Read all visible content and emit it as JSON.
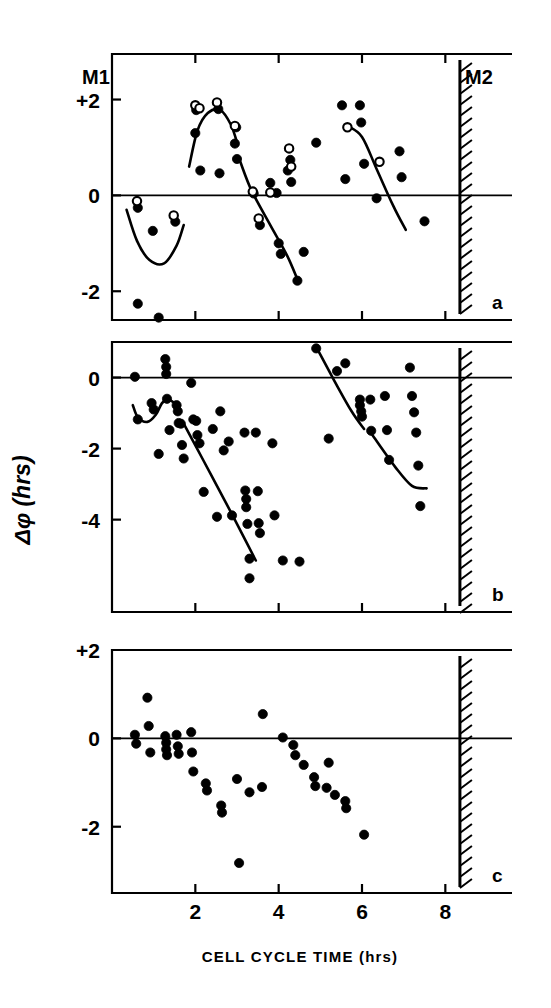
{
  "figure": {
    "title": "",
    "xlabel": "CELL CYCLE TIME (hrs)",
    "ylabel": "Δφ (hrs)",
    "m1_label": "M1",
    "m2_label": "M2",
    "panel_a_label": "a",
    "panel_b_label": "b",
    "panel_c_label": "c",
    "ink_color": "#000000",
    "background_color": "#ffffff"
  },
  "chart_data": [
    {
      "type": "scatter",
      "panel": "a",
      "title": "",
      "xlabel": "CELL CYCLE TIME (hrs)",
      "ylabel": "Δφ (hrs)",
      "xlim": [
        0,
        9.6
      ],
      "ylim": [
        -2.6,
        2.95
      ],
      "xticks": [
        2,
        4,
        6,
        8
      ],
      "xticklabels": [
        "2",
        "4",
        "6",
        "8"
      ],
      "yticks": [
        2,
        0,
        -2
      ],
      "yticklabels": [
        "+2",
        "0",
        "-2"
      ],
      "grid": false,
      "zero_line": true,
      "m2_bar_x": 8.35,
      "annotations": [
        "M1",
        "M2",
        "a"
      ],
      "series": [
        {
          "name": "filled-circles",
          "marker": "filled",
          "points": [
            [
              0.62,
              -0.26
            ],
            [
              0.62,
              -2.26
            ],
            [
              0.98,
              -0.74
            ],
            [
              1.12,
              -2.55
            ],
            [
              1.52,
              -0.55
            ],
            [
              2.0,
              1.3
            ],
            [
              2.02,
              1.78
            ],
            [
              2.12,
              0.52
            ],
            [
              2.55,
              1.8
            ],
            [
              2.58,
              0.46
            ],
            [
              2.95,
              1.08
            ],
            [
              2.98,
              1.42
            ],
            [
              3.0,
              0.76
            ],
            [
              3.4,
              0.04
            ],
            [
              3.55,
              -0.62
            ],
            [
              3.8,
              0.26
            ],
            [
              3.95,
              0.05
            ],
            [
              4.0,
              -1.0
            ],
            [
              4.05,
              -1.22
            ],
            [
              4.22,
              0.52
            ],
            [
              4.28,
              0.74
            ],
            [
              4.3,
              0.28
            ],
            [
              4.45,
              -1.78
            ],
            [
              4.6,
              -1.18
            ],
            [
              4.9,
              1.1
            ],
            [
              5.52,
              1.88
            ],
            [
              5.6,
              0.34
            ],
            [
              5.95,
              1.88
            ],
            [
              5.98,
              1.52
            ],
            [
              6.05,
              0.66
            ],
            [
              6.35,
              -0.06
            ],
            [
              6.9,
              0.92
            ],
            [
              6.95,
              0.38
            ],
            [
              7.5,
              -0.54
            ]
          ]
        },
        {
          "name": "open-circles",
          "marker": "open",
          "points": [
            [
              0.6,
              -0.12
            ],
            [
              1.48,
              -0.42
            ],
            [
              2.0,
              1.88
            ],
            [
              2.1,
              1.82
            ],
            [
              2.52,
              1.94
            ],
            [
              2.95,
              1.45
            ],
            [
              3.38,
              0.08
            ],
            [
              3.52,
              -0.48
            ],
            [
              3.8,
              0.06
            ],
            [
              4.25,
              0.98
            ],
            [
              4.3,
              0.6
            ],
            [
              5.65,
              1.42
            ],
            [
              6.42,
              0.7
            ]
          ]
        }
      ],
      "curves": [
        {
          "name": "curve-1",
          "points": [
            [
              0.35,
              -0.3
            ],
            [
              0.6,
              -0.95
            ],
            [
              0.9,
              -1.35
            ],
            [
              1.25,
              -1.42
            ],
            [
              1.55,
              -1.05
            ],
            [
              1.72,
              -0.62
            ]
          ]
        },
        {
          "name": "curve-2",
          "points": [
            [
              1.85,
              0.6
            ],
            [
              2.05,
              1.35
            ],
            [
              2.3,
              1.72
            ],
            [
              2.6,
              1.78
            ],
            [
              2.85,
              1.48
            ],
            [
              3.02,
              1.05
            ]
          ]
        },
        {
          "name": "curve-3",
          "points": [
            [
              3.08,
              0.7
            ],
            [
              3.35,
              0.1
            ],
            [
              3.8,
              -0.62
            ],
            [
              4.2,
              -1.25
            ],
            [
              4.45,
              -1.75
            ]
          ]
        },
        {
          "name": "curve-4",
          "points": [
            [
              5.65,
              1.45
            ],
            [
              6.0,
              1.22
            ],
            [
              6.35,
              0.55
            ],
            [
              6.75,
              -0.22
            ],
            [
              7.05,
              -0.72
            ]
          ]
        }
      ]
    },
    {
      "type": "scatter",
      "panel": "b",
      "title": "",
      "xlabel": "CELL CYCLE TIME (hrs)",
      "ylabel": "Δφ (hrs)",
      "xlim": [
        0,
        9.6
      ],
      "ylim": [
        -6.6,
        1.0
      ],
      "xticks": [
        2,
        4,
        6,
        8
      ],
      "xticklabels": [
        "2",
        "4",
        "6",
        "8"
      ],
      "yticks": [
        0,
        -2,
        -4
      ],
      "yticklabels": [
        "0",
        "-2",
        "-4"
      ],
      "grid": false,
      "zero_line": true,
      "m2_bar_x": 8.35,
      "annotations": [
        "b"
      ],
      "series": [
        {
          "name": "filled-circles",
          "marker": "filled",
          "points": [
            [
              0.55,
              0.02
            ],
            [
              0.62,
              -1.18
            ],
            [
              0.95,
              -0.72
            ],
            [
              1.0,
              -0.9
            ],
            [
              1.12,
              -2.15
            ],
            [
              1.28,
              0.52
            ],
            [
              1.3,
              0.3
            ],
            [
              1.3,
              0.1
            ],
            [
              1.32,
              -0.6
            ],
            [
              1.38,
              -1.48
            ],
            [
              1.55,
              -0.78
            ],
            [
              1.58,
              -0.95
            ],
            [
              1.6,
              -1.28
            ],
            [
              1.65,
              -1.3
            ],
            [
              1.68,
              -1.9
            ],
            [
              1.72,
              -2.28
            ],
            [
              1.9,
              -0.15
            ],
            [
              1.95,
              -1.18
            ],
            [
              2.02,
              -1.22
            ],
            [
              2.05,
              -1.62
            ],
            [
              2.1,
              -1.85
            ],
            [
              2.2,
              -3.22
            ],
            [
              2.42,
              -1.45
            ],
            [
              2.52,
              -3.92
            ],
            [
              2.6,
              -0.95
            ],
            [
              2.68,
              -2.05
            ],
            [
              2.8,
              -1.8
            ],
            [
              2.88,
              -3.88
            ],
            [
              3.18,
              -1.55
            ],
            [
              3.2,
              -3.18
            ],
            [
              3.22,
              -3.42
            ],
            [
              3.22,
              -3.65
            ],
            [
              3.25,
              -4.12
            ],
            [
              3.3,
              -5.1
            ],
            [
              3.3,
              -5.65
            ],
            [
              3.45,
              -1.55
            ],
            [
              3.5,
              -3.2
            ],
            [
              3.52,
              -4.1
            ],
            [
              3.55,
              -4.38
            ],
            [
              3.85,
              -1.85
            ],
            [
              3.9,
              -3.88
            ],
            [
              4.1,
              -5.15
            ],
            [
              4.5,
              -5.18
            ],
            [
              4.9,
              0.82
            ],
            [
              5.2,
              -1.72
            ],
            [
              5.4,
              0.18
            ],
            [
              5.6,
              0.4
            ],
            [
              5.95,
              -0.62
            ],
            [
              5.95,
              -0.78
            ],
            [
              5.98,
              -0.95
            ],
            [
              6.0,
              -1.1
            ],
            [
              6.2,
              -0.62
            ],
            [
              6.22,
              -1.5
            ],
            [
              6.55,
              -0.52
            ],
            [
              6.6,
              -1.48
            ],
            [
              6.65,
              -2.32
            ],
            [
              7.15,
              0.28
            ],
            [
              7.2,
              -0.52
            ],
            [
              7.25,
              -0.98
            ],
            [
              7.3,
              -1.55
            ],
            [
              7.35,
              -2.48
            ],
            [
              7.4,
              -3.62
            ]
          ]
        }
      ],
      "curves": [
        {
          "name": "curve-1",
          "points": [
            [
              0.5,
              -0.78
            ],
            [
              0.62,
              -1.12
            ],
            [
              0.85,
              -1.25
            ],
            [
              1.05,
              -1.05
            ],
            [
              1.2,
              -0.72
            ],
            [
              1.35,
              -0.62
            ],
            [
              1.5,
              -0.72
            ]
          ]
        },
        {
          "name": "curve-2",
          "points": [
            [
              1.72,
              -1.3
            ],
            [
              2.2,
              -2.35
            ],
            [
              2.7,
              -3.45
            ],
            [
              3.1,
              -4.35
            ],
            [
              3.45,
              -5.15
            ]
          ]
        },
        {
          "name": "curve-3",
          "points": [
            [
              4.92,
              0.82
            ],
            [
              5.35,
              -0.12
            ],
            [
              5.75,
              -0.95
            ],
            [
              6.05,
              -1.45
            ]
          ]
        },
        {
          "name": "curve-4",
          "points": [
            [
              6.25,
              -1.62
            ],
            [
              6.8,
              -2.52
            ],
            [
              7.2,
              -3.05
            ],
            [
              7.55,
              -3.12
            ]
          ]
        }
      ]
    },
    {
      "type": "scatter",
      "panel": "c",
      "title": "",
      "xlabel": "CELL CYCLE TIME (hrs)",
      "ylabel": "Δφ (hrs)",
      "xlim": [
        0,
        9.6
      ],
      "ylim": [
        -3.5,
        2.0
      ],
      "xticks": [
        2,
        4,
        6,
        8
      ],
      "xticklabels": [
        "2",
        "4",
        "6",
        "8"
      ],
      "yticks": [
        2,
        0,
        -2
      ],
      "yticklabels": [
        "+2",
        "0",
        "-2"
      ],
      "grid": false,
      "zero_line": true,
      "m2_bar_x": 8.35,
      "annotations": [
        "c"
      ],
      "series": [
        {
          "name": "filled-circles",
          "marker": "filled",
          "points": [
            [
              0.55,
              0.08
            ],
            [
              0.58,
              -0.12
            ],
            [
              0.85,
              0.92
            ],
            [
              0.88,
              0.28
            ],
            [
              0.92,
              -0.32
            ],
            [
              1.28,
              0.05
            ],
            [
              1.3,
              -0.1
            ],
            [
              1.3,
              -0.25
            ],
            [
              1.32,
              -0.38
            ],
            [
              1.55,
              0.08
            ],
            [
              1.58,
              -0.18
            ],
            [
              1.6,
              -0.35
            ],
            [
              1.9,
              0.14
            ],
            [
              1.92,
              -0.32
            ],
            [
              1.95,
              -0.75
            ],
            [
              2.25,
              -1.02
            ],
            [
              2.28,
              -1.18
            ],
            [
              2.62,
              -1.52
            ],
            [
              2.64,
              -1.68
            ],
            [
              3.0,
              -0.92
            ],
            [
              3.05,
              -2.82
            ],
            [
              3.3,
              -1.22
            ],
            [
              3.6,
              -1.1
            ],
            [
              3.62,
              0.55
            ],
            [
              4.1,
              0.02
            ],
            [
              4.35,
              -0.15
            ],
            [
              4.4,
              -0.38
            ],
            [
              4.6,
              -0.6
            ],
            [
              4.85,
              -0.88
            ],
            [
              4.88,
              -1.08
            ],
            [
              5.15,
              -1.12
            ],
            [
              5.2,
              -0.55
            ],
            [
              5.35,
              -1.28
            ],
            [
              5.6,
              -1.42
            ],
            [
              5.62,
              -1.58
            ],
            [
              6.05,
              -2.18
            ]
          ]
        }
      ],
      "curves": []
    }
  ]
}
